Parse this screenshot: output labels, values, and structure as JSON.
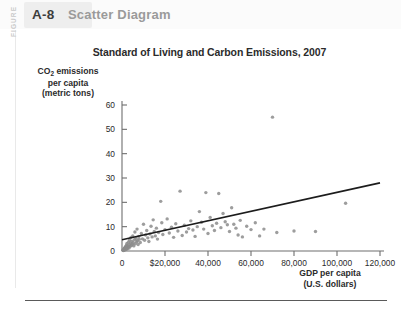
{
  "figure": {
    "kicker": "FIGURE",
    "number": "A-8",
    "title": "Scatter Diagram"
  },
  "chart_data": {
    "type": "scatter",
    "title": "Standard of Living and Carbon Emissions, 2007",
    "xlabel": "GDP per capita (U.S. dollars)",
    "xlabel_line1": "GDP per capita",
    "xlabel_line2": "(U.S. dollars)",
    "ylabel": "CO2 emissions per capita (metric tons)",
    "ylabel_line1": "CO",
    "ylabel_sub": "2",
    "ylabel_line1b": " emissions",
    "ylabel_line2": "per capita",
    "ylabel_line3": "(metric tons)",
    "xlim": [
      0,
      120000
    ],
    "ylim": [
      0,
      60
    ],
    "xticks": [
      0,
      20000,
      40000,
      60000,
      80000,
      100000,
      120000
    ],
    "xticklabels": [
      "0",
      "$20,000",
      "40,000",
      "60,000",
      "80,000",
      "100,000",
      "120,000"
    ],
    "yticks": [
      0,
      10,
      20,
      30,
      40,
      50,
      60
    ],
    "yticklabels": [
      "0",
      "10",
      "20",
      "30",
      "40",
      "50",
      "60"
    ],
    "grid": false,
    "legend": "none",
    "marker_color": "#8c8c8c",
    "trendline_color": "#1c1c1c",
    "axis_color": "#6e6e6e",
    "trendline": {
      "x0": 0,
      "y0": 4.6,
      "x1": 120000,
      "y1": 28.0
    },
    "points": [
      [
        400,
        0.3
      ],
      [
        600,
        0.2
      ],
      [
        700,
        0.5
      ],
      [
        800,
        0.3
      ],
      [
        900,
        0.8
      ],
      [
        1000,
        0.4
      ],
      [
        1100,
        1.0
      ],
      [
        1200,
        0.6
      ],
      [
        1300,
        1.4
      ],
      [
        1400,
        0.9
      ],
      [
        1500,
        0.5
      ],
      [
        1600,
        1.6
      ],
      [
        1700,
        1.1
      ],
      [
        1800,
        2.0
      ],
      [
        1900,
        0.7
      ],
      [
        2000,
        1.3
      ],
      [
        2100,
        2.4
      ],
      [
        2200,
        1.0
      ],
      [
        2300,
        3.1
      ],
      [
        2400,
        1.8
      ],
      [
        2500,
        0.9
      ],
      [
        2600,
        2.2
      ],
      [
        2800,
        1.5
      ],
      [
        3000,
        3.6
      ],
      [
        3100,
        2.0
      ],
      [
        3300,
        1.2
      ],
      [
        3500,
        4.4
      ],
      [
        3600,
        2.6
      ],
      [
        3800,
        1.9
      ],
      [
        4000,
        3.2
      ],
      [
        4200,
        5.6
      ],
      [
        4400,
        2.3
      ],
      [
        4600,
        4.0
      ],
      [
        4800,
        2.8
      ],
      [
        5000,
        6.2
      ],
      [
        5200,
        3.4
      ],
      [
        5500,
        2.1
      ],
      [
        5800,
        4.6
      ],
      [
        6000,
        7.8
      ],
      [
        6200,
        3.0
      ],
      [
        6500,
        5.2
      ],
      [
        6800,
        3.8
      ],
      [
        7000,
        9.0
      ],
      [
        7200,
        4.2
      ],
      [
        7500,
        2.7
      ],
      [
        7800,
        6.0
      ],
      [
        8000,
        4.8
      ],
      [
        8500,
        3.5
      ],
      [
        9000,
        7.2
      ],
      [
        9500,
        5.0
      ],
      [
        10000,
        11.0
      ],
      [
        10500,
        4.4
      ],
      [
        11000,
        6.6
      ],
      [
        11500,
        8.4
      ],
      [
        12000,
        5.4
      ],
      [
        12500,
        3.9
      ],
      [
        13000,
        7.0
      ],
      [
        13500,
        10.2
      ],
      [
        14000,
        5.8
      ],
      [
        14500,
        12.8
      ],
      [
        15000,
        8.0
      ],
      [
        15500,
        6.2
      ],
      [
        16000,
        9.4
      ],
      [
        16500,
        4.9
      ],
      [
        17000,
        7.6
      ],
      [
        18000,
        20.4
      ],
      [
        18500,
        11.6
      ],
      [
        19000,
        6.8
      ],
      [
        20000,
        8.8
      ],
      [
        21000,
        13.2
      ],
      [
        22000,
        7.4
      ],
      [
        23000,
        9.8
      ],
      [
        24000,
        5.6
      ],
      [
        25000,
        11.2
      ],
      [
        26000,
        8.2
      ],
      [
        27000,
        24.6
      ],
      [
        28000,
        6.4
      ],
      [
        29000,
        10.6
      ],
      [
        30000,
        7.8
      ],
      [
        31000,
        9.2
      ],
      [
        32000,
        12.4
      ],
      [
        33000,
        8.6
      ],
      [
        34000,
        6.0
      ],
      [
        35000,
        10.0
      ],
      [
        36000,
        16.2
      ],
      [
        37000,
        11.8
      ],
      [
        38000,
        9.0
      ],
      [
        39000,
        24.0
      ],
      [
        40000,
        7.2
      ],
      [
        41000,
        13.8
      ],
      [
        42000,
        10.4
      ],
      [
        43000,
        8.4
      ],
      [
        44000,
        11.4
      ],
      [
        45000,
        23.6
      ],
      [
        46000,
        9.6
      ],
      [
        47000,
        15.4
      ],
      [
        48000,
        12.0
      ],
      [
        49000,
        10.8
      ],
      [
        50000,
        8.0
      ],
      [
        51000,
        17.8
      ],
      [
        52000,
        11.0
      ],
      [
        53000,
        9.4
      ],
      [
        54000,
        6.6
      ],
      [
        55000,
        12.6
      ],
      [
        56000,
        5.8
      ],
      [
        58000,
        10.2
      ],
      [
        60000,
        8.8
      ],
      [
        62000,
        11.6
      ],
      [
        64000,
        6.2
      ],
      [
        66000,
        9.0
      ],
      [
        70000,
        55.0
      ],
      [
        72000,
        7.6
      ],
      [
        80000,
        8.2
      ],
      [
        90000,
        8.0
      ],
      [
        104000,
        19.6
      ]
    ]
  }
}
